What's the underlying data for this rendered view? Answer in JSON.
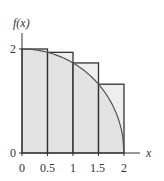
{
  "chart_data": {
    "type": "bar",
    "title": "",
    "xlabel": "x",
    "ylabel": "f(x)",
    "categories": [
      "0-0.5",
      "0.5-1",
      "1-1.5",
      "1.5-2"
    ],
    "rect_left": [
      0,
      0.5,
      1,
      1.5
    ],
    "rect_width": 0.5,
    "values": [
      2.0,
      1.936,
      1.732,
      1.323
    ],
    "curve": {
      "expr": "sqrt(4 - x^2)",
      "domain": [
        0,
        2
      ]
    },
    "xticks": [
      "0",
      "0.5",
      "1",
      "1.5",
      "2"
    ],
    "yticks": [
      "0",
      "2"
    ],
    "xlim": [
      0,
      2.3
    ],
    "ylim": [
      0,
      2.4
    ],
    "grid": false,
    "colors": {
      "fill": "#e3e3e3",
      "stroke": "#333333",
      "curve": "#555555"
    }
  }
}
